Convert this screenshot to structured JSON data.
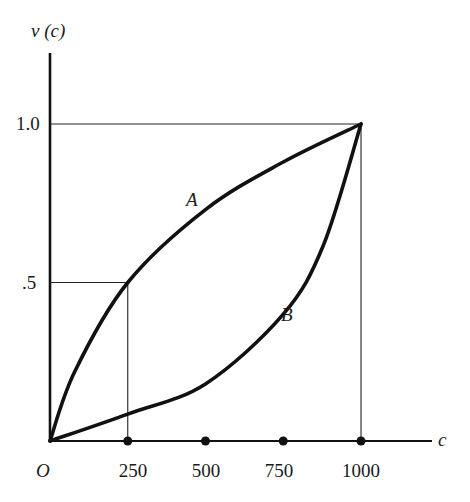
{
  "chart_data": {
    "type": "line",
    "title": "",
    "xlabel": "c",
    "ylabel": "v (c)",
    "origin_label": "O",
    "xlim": [
      0,
      1000
    ],
    "ylim": [
      0,
      1.0
    ],
    "grid": false,
    "legend": "none (curves labeled inline)",
    "x_ticks": [
      250,
      500,
      750,
      1000
    ],
    "x_tick_labels": [
      "250",
      "500",
      "750",
      "1000"
    ],
    "y_ticks": [
      0.5,
      1.0
    ],
    "y_tick_labels": [
      ".5",
      "1.0"
    ],
    "x": [
      0,
      250,
      500,
      750,
      1000
    ],
    "series": [
      {
        "name": "A",
        "shape": "concave",
        "values": [
          0,
          0.5,
          0.73,
          0.88,
          1.0
        ]
      },
      {
        "name": "B",
        "shape": "convex",
        "values": [
          0,
          0.085,
          0.18,
          0.4,
          1.0
        ]
      }
    ],
    "annotations": [
      {
        "type": "reference-lines",
        "text": "guide lines from (250, .5) to both axes"
      },
      {
        "type": "reference-lines",
        "text": "guide lines from (1000, 1.0) to both axes"
      },
      {
        "type": "curve-label",
        "text": "A",
        "near": [
          480,
          0.75
        ]
      },
      {
        "type": "curve-label",
        "text": "B",
        "near": [
          770,
          0.4
        ]
      }
    ]
  },
  "labels": {
    "y_axis": "v (c)",
    "x_axis": "c",
    "origin": "O",
    "y_tick_half": ".5",
    "y_tick_one": "1.0",
    "x_tick_250": "250",
    "x_tick_500": "500",
    "x_tick_750": "750",
    "x_tick_1000": "1000",
    "curve_a": "A",
    "curve_b": "B"
  }
}
